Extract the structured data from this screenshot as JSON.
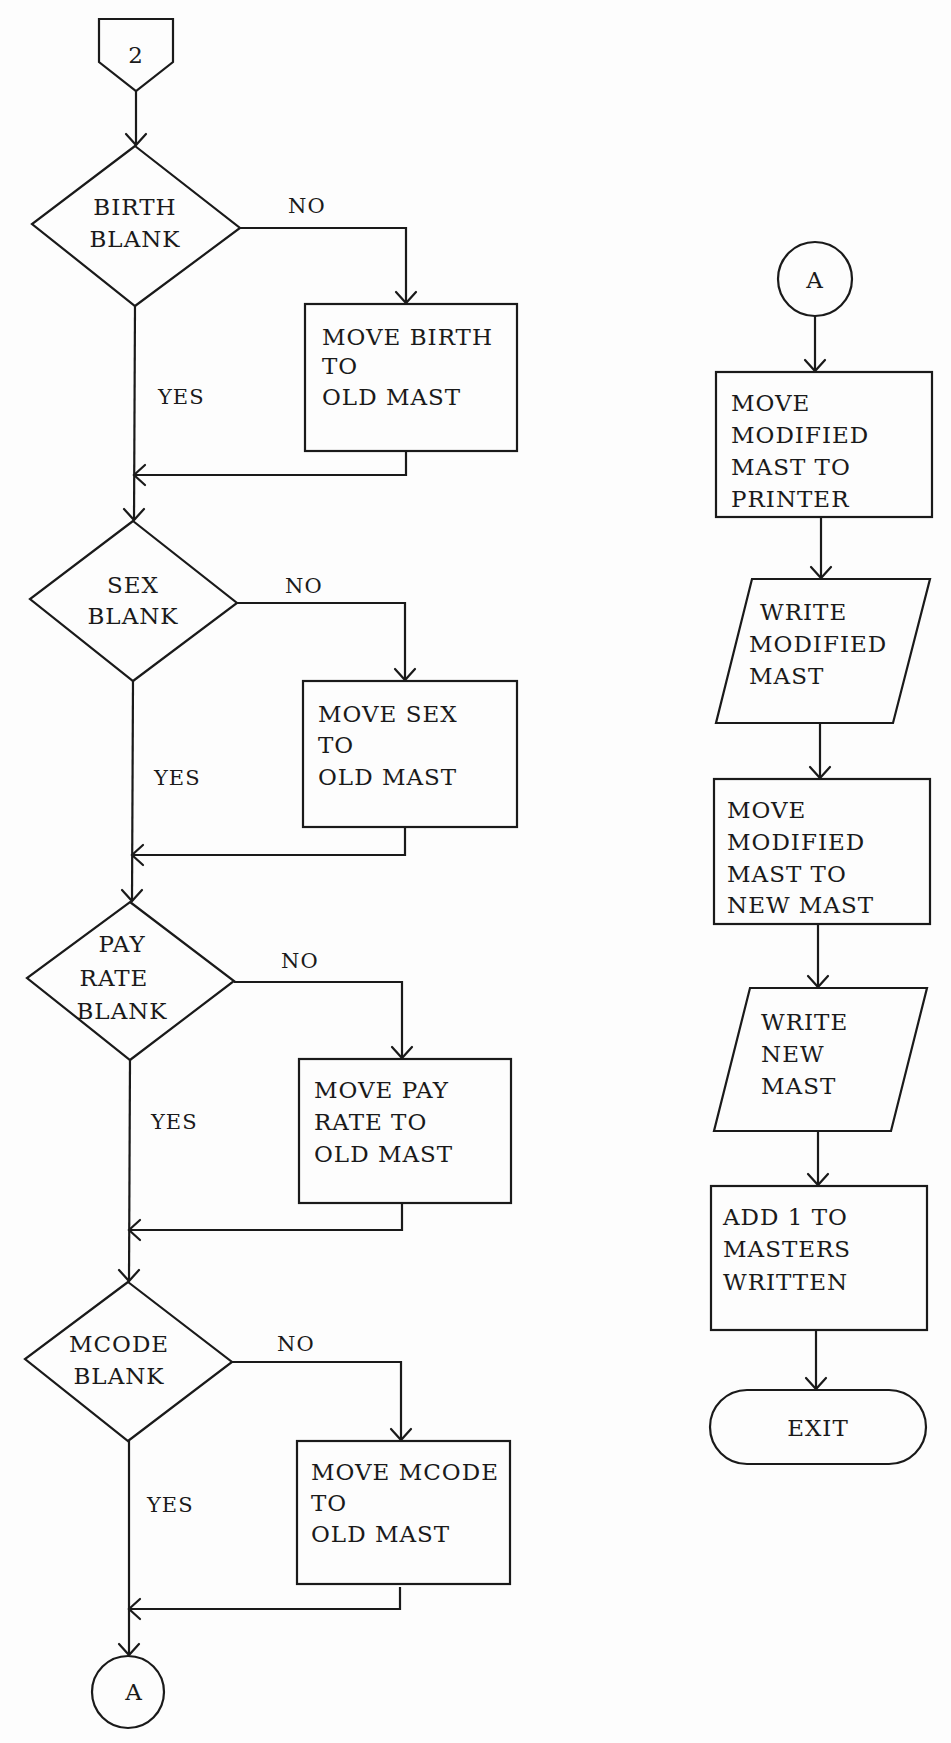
{
  "diagram": {
    "type": "flowchart",
    "entry_connector": {
      "label": "2",
      "shape": "offpage-connector"
    },
    "left_column": {
      "decisions": [
        {
          "id": "birth",
          "lines": [
            "BIRTH",
            "BLANK"
          ],
          "no_label": "NO",
          "yes_label": "YES",
          "action": {
            "lines": [
              "MOVE BIRTH",
              "TO",
              "OLD MAST"
            ]
          }
        },
        {
          "id": "sex",
          "lines": [
            "SEX",
            "BLANK"
          ],
          "no_label": "NO",
          "yes_label": "YES",
          "action": {
            "lines": [
              "MOVE SEX",
              "TO",
              "OLD MAST"
            ]
          }
        },
        {
          "id": "payrate",
          "lines": [
            "PAY",
            "RATE",
            "BLANK"
          ],
          "no_label": "NO",
          "yes_label": "YES",
          "action": {
            "lines": [
              "MOVE PAY",
              "RATE TO",
              "OLD MAST"
            ]
          }
        },
        {
          "id": "mcode",
          "lines": [
            "MCODE",
            "BLANK"
          ],
          "no_label": "NO",
          "yes_label": "YES",
          "action": {
            "lines": [
              "MOVE MCODE",
              "TO",
              "OLD MAST"
            ]
          }
        }
      ],
      "exit_connector": {
        "label": "A",
        "shape": "onpage-connector"
      }
    },
    "right_column": {
      "entry_connector": {
        "label": "A",
        "shape": "onpage-connector"
      },
      "steps": [
        {
          "shape": "process",
          "lines": [
            "MOVE",
            "MODIFIED",
            "MAST TO",
            "PRINTER"
          ]
        },
        {
          "shape": "io",
          "lines": [
            "WRITE",
            "MODIFIED",
            "MAST"
          ]
        },
        {
          "shape": "process",
          "lines": [
            "MOVE",
            "MODIFIED",
            "MAST TO",
            "NEW MAST"
          ]
        },
        {
          "shape": "io",
          "lines": [
            "WRITE",
            "NEW",
            "MAST"
          ]
        },
        {
          "shape": "process",
          "lines": [
            "ADD 1 TO",
            "MASTERS",
            "WRITTEN"
          ]
        },
        {
          "shape": "terminal",
          "lines": [
            "EXIT"
          ]
        }
      ]
    }
  }
}
